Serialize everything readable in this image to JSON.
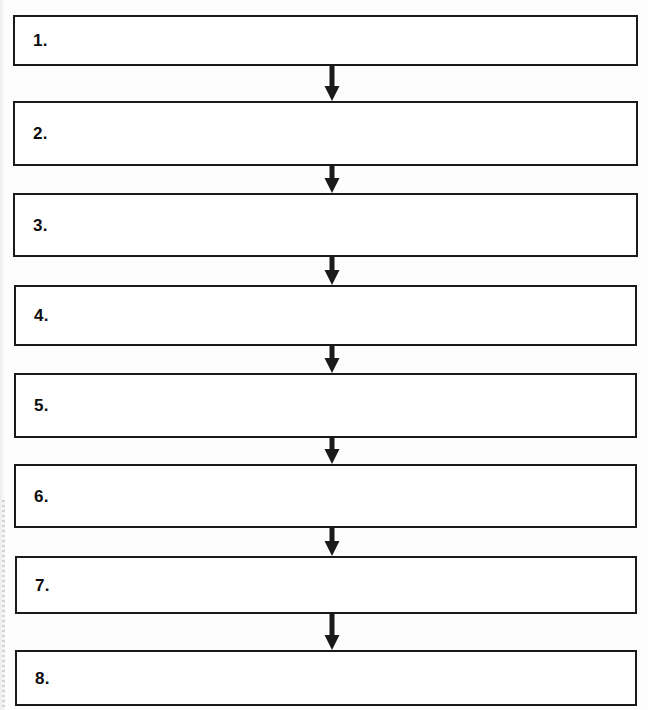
{
  "document": {
    "title": "Eight-step blank process flowchart",
    "type": "flowchart",
    "orientation": "vertical top-to-bottom",
    "background_color": "#fdfdfd",
    "line_color": "#1a1a1a",
    "text_color": "#0d0d0d"
  },
  "flowchart": {
    "step_count": 8,
    "connector_count": 7,
    "connector_shape": "down-arrow",
    "steps": [
      {
        "number": "1.",
        "text": "",
        "x": 13,
        "y": 15,
        "width": 625,
        "height": 51
      },
      {
        "number": "2.",
        "text": "",
        "x": 13,
        "y": 101,
        "width": 625,
        "height": 65
      },
      {
        "number": "3.",
        "text": "",
        "x": 13,
        "y": 193,
        "width": 625,
        "height": 64
      },
      {
        "number": "4.",
        "text": "",
        "x": 14,
        "y": 285,
        "width": 623,
        "height": 61
      },
      {
        "number": "5.",
        "text": "",
        "x": 14,
        "y": 373,
        "width": 623,
        "height": 65
      },
      {
        "number": "6.",
        "text": "",
        "x": 14,
        "y": 464,
        "width": 623,
        "height": 64
      },
      {
        "number": "7.",
        "text": "",
        "x": 15,
        "y": 556,
        "width": 622,
        "height": 58
      },
      {
        "number": "8.",
        "text": "",
        "x": 15,
        "y": 650,
        "width": 622,
        "height": 56
      }
    ],
    "connectors": [
      {
        "from": "1.",
        "to": "2.",
        "x": 322,
        "y": 66,
        "height": 35
      },
      {
        "from": "2.",
        "to": "3.",
        "x": 322,
        "y": 166,
        "height": 27
      },
      {
        "from": "3.",
        "to": "4.",
        "x": 322,
        "y": 257,
        "height": 28
      },
      {
        "from": "4.",
        "to": "5.",
        "x": 322,
        "y": 346,
        "height": 27
      },
      {
        "from": "5.",
        "to": "6.",
        "x": 322,
        "y": 438,
        "height": 26
      },
      {
        "from": "6.",
        "to": "7.",
        "x": 322,
        "y": 528,
        "height": 28
      },
      {
        "from": "7.",
        "to": "8.",
        "x": 322,
        "y": 614,
        "height": 36
      }
    ]
  }
}
